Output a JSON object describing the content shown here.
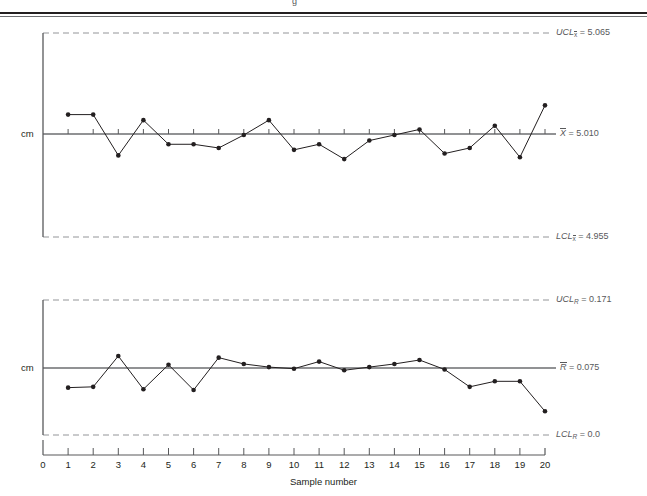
{
  "figure": {
    "cut_off_header_fragment": "g",
    "x_axis_title": "Sample number",
    "y_axis_label_top": "cm",
    "y_axis_label_bottom": "cm",
    "tick_labels": [
      "0",
      "1",
      "2",
      "3",
      "4",
      "5",
      "6",
      "7",
      "8",
      "9",
      "10",
      "11",
      "12",
      "13",
      "14",
      "15",
      "16",
      "17",
      "18",
      "19",
      "20"
    ]
  },
  "xbar_chart": {
    "ucl_label": "UCL",
    "ucl_sub": "x̅",
    "ucl_value": "5.065",
    "ucl_text": "UCL = 5.065",
    "center_label": "X̅",
    "center_value": "5.010",
    "center_text": "X̅ = 5.010",
    "lcl_label": "LCL",
    "lcl_sub": "x̅",
    "lcl_value": "4.955",
    "lcl_text": "LCL = 4.955"
  },
  "r_chart": {
    "ucl_label": "UCL",
    "ucl_sub": "R",
    "ucl_value": "0.171",
    "ucl_text": "UCL = 0.171",
    "center_label": "R̅",
    "center_value": "0.075",
    "center_text": "R̅ = 0.075",
    "lcl_label": "LCL",
    "lcl_sub": "R",
    "lcl_value": "0.0",
    "lcl_text": "LCL = 0.0"
  },
  "chart_data": [
    {
      "type": "line",
      "title": "X-bar control chart",
      "xlabel": "Sample number",
      "ylabel": "cm",
      "x": [
        1,
        2,
        3,
        4,
        5,
        6,
        7,
        8,
        9,
        10,
        11,
        12,
        13,
        14,
        15,
        16,
        17,
        18,
        19,
        20
      ],
      "values": [
        5.021,
        5.021,
        4.999,
        5.018,
        5.005,
        5.005,
        5.003,
        5.01,
        5.018,
        5.002,
        5.005,
        4.997,
        5.007,
        5.01,
        5.013,
        5.0,
        5.003,
        5.015,
        4.998,
        5.026
      ],
      "ucl": 5.065,
      "center": 5.01,
      "lcl": 4.955,
      "ylim": [
        4.955,
        5.065
      ],
      "grid": false,
      "legend": "none"
    },
    {
      "type": "line",
      "title": "R control chart",
      "xlabel": "Sample number",
      "ylabel": "cm",
      "x": [
        1,
        2,
        3,
        4,
        5,
        6,
        7,
        8,
        9,
        10,
        11,
        12,
        13,
        14,
        15,
        16,
        17,
        18,
        19,
        20
      ],
      "values": [
        0.06,
        0.061,
        0.1,
        0.058,
        0.089,
        0.057,
        0.098,
        0.09,
        0.086,
        0.084,
        0.093,
        0.082,
        0.086,
        0.09,
        0.095,
        0.083,
        0.061,
        0.068,
        0.068,
        0.03
      ],
      "ucl": 0.171,
      "center": 0.075,
      "lcl": 0.0,
      "ylim": [
        0.0,
        0.171
      ],
      "grid": false,
      "legend": "none"
    }
  ]
}
